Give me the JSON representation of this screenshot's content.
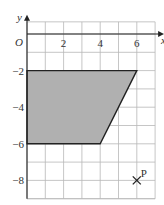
{
  "diagram": {
    "axes": {
      "x_label": "x",
      "y_label": "y",
      "origin_label": "O",
      "x_ticks": [
        {
          "value": 2,
          "label": "2"
        },
        {
          "value": 4,
          "label": "4"
        },
        {
          "value": 6,
          "label": "6"
        }
      ],
      "y_ticks": [
        {
          "value": -2,
          "label": "−2"
        },
        {
          "value": -4,
          "label": "−4"
        },
        {
          "value": -6,
          "label": "−6"
        },
        {
          "value": -8,
          "label": "−8"
        }
      ],
      "x_range": [
        0,
        7
      ],
      "y_range": [
        -9,
        0.5
      ],
      "grid": true
    },
    "shape": {
      "type": "trapezium",
      "vertices": [
        [
          0,
          -2
        ],
        [
          6,
          -2
        ],
        [
          4,
          -6
        ],
        [
          0,
          -6
        ]
      ],
      "fill": "#b0b0b0"
    },
    "point": {
      "label": "P",
      "x": 6,
      "y": -8,
      "marker": "cross"
    }
  }
}
